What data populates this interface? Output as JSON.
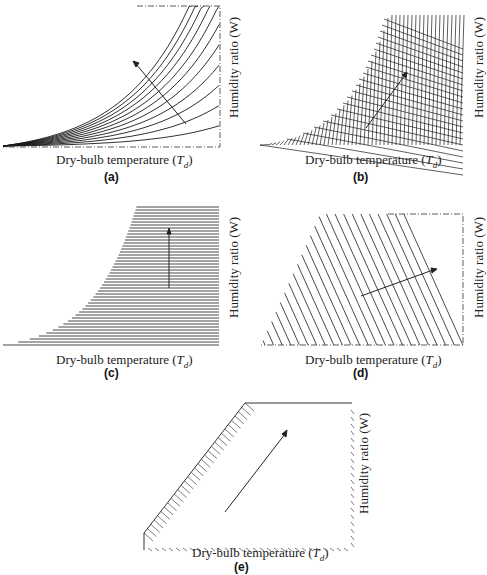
{
  "figure": {
    "panels": [
      {
        "id": "a",
        "caption": "(a)",
        "xlabel_prefix": "Dry-bulb temperature (",
        "xlabel_var": "T",
        "xlabel_sub": "d",
        "xlabel_suffix": ")",
        "ylabel": "Humidity ratio (W)",
        "description": "Family of relative humidity curves rising exponentially; arrow points toward increasing relative humidity (up-left)"
      },
      {
        "id": "b",
        "caption": "(b)",
        "xlabel_prefix": "Dry-bulb temperature (",
        "xlabel_var": "T",
        "xlabel_sub": "d",
        "xlabel_suffix": ")",
        "ylabel": "Humidity ratio (W)",
        "description": "Dense grid of steep wet-bulb / enthalpy-type lines below saturation curve; arrow pointing up-right"
      },
      {
        "id": "c",
        "caption": "(c)",
        "xlabel_prefix": "Dry-bulb temperature (",
        "xlabel_var": "T",
        "xlabel_sub": "d",
        "xlabel_suffix": ")",
        "ylabel": "Humidity ratio (W)",
        "description": "Horizontal constant humidity ratio lines below saturation curve; vertical arrow pointing up"
      },
      {
        "id": "d",
        "caption": "(d)",
        "xlabel_prefix": "Dry-bulb temperature (",
        "xlabel_var": "T",
        "xlabel_sub": "d",
        "xlabel_suffix": ")",
        "ylabel": "Humidity ratio (W)",
        "description": "Diagonal constant enthalpy / wet-bulb lines; arrow pointing right-up"
      },
      {
        "id": "e",
        "caption": "(e)",
        "xlabel_prefix": "Dry-bulb temperature (",
        "xlabel_var": "T",
        "xlabel_sub": "d",
        "xlabel_suffix": ")",
        "ylabel": "Humidity ratio (W)",
        "description": "Simplified chart with hatched saturation boundary on left and hatched axes; diagonal arrow pointing up-right"
      }
    ]
  },
  "colors": {
    "line": "#1a1a1a",
    "background": "#ffffff"
  }
}
